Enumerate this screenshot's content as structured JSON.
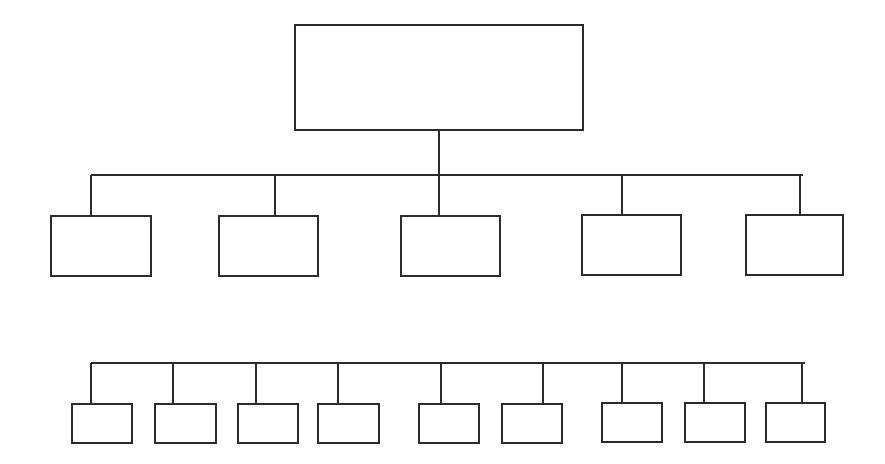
{
  "diagram": {
    "type": "org-chart",
    "stroke_color": "#2b2b2b",
    "background": "#ffffff",
    "root": {
      "label": "",
      "x": 294,
      "y": 24,
      "w": 290,
      "h": 107
    },
    "root_connector": {
      "x": 439,
      "y1": 131,
      "y2": 175
    },
    "level1_bus": {
      "x1": 91,
      "x2": 801,
      "y": 175
    },
    "level1": [
      {
        "label": "",
        "x": 50,
        "y": 215,
        "w": 102,
        "h": 62,
        "cx": 91
      },
      {
        "label": "",
        "x": 218,
        "y": 215,
        "w": 101,
        "h": 62,
        "cx": 275
      },
      {
        "label": "",
        "x": 400,
        "y": 215,
        "w": 101,
        "h": 62,
        "cx": 439
      },
      {
        "label": "",
        "x": 581,
        "y": 214,
        "w": 101,
        "h": 62,
        "cx": 622
      },
      {
        "label": "",
        "x": 745,
        "y": 214,
        "w": 99,
        "h": 62,
        "cx": 800
      }
    ],
    "level2_bus": {
      "x1": 91,
      "x2": 803,
      "y": 363
    },
    "level2": [
      {
        "label": "",
        "x": 71,
        "y": 403,
        "w": 62,
        "h": 41,
        "cx": 91
      },
      {
        "label": "",
        "x": 154,
        "y": 403,
        "w": 63,
        "h": 41,
        "cx": 173
      },
      {
        "label": "",
        "x": 237,
        "y": 403,
        "w": 62,
        "h": 41,
        "cx": 256
      },
      {
        "label": "",
        "x": 317,
        "y": 403,
        "w": 63,
        "h": 41,
        "cx": 338
      },
      {
        "label": "",
        "x": 418,
        "y": 403,
        "w": 62,
        "h": 41,
        "cx": 441
      },
      {
        "label": "",
        "x": 501,
        "y": 403,
        "w": 62,
        "h": 41,
        "cx": 543
      },
      {
        "label": "",
        "x": 601,
        "y": 402,
        "w": 62,
        "h": 41,
        "cx": 622
      },
      {
        "label": "",
        "x": 684,
        "y": 402,
        "w": 62,
        "h": 41,
        "cx": 704
      },
      {
        "label": "",
        "x": 765,
        "y": 402,
        "w": 61,
        "h": 41,
        "cx": 802
      }
    ]
  }
}
